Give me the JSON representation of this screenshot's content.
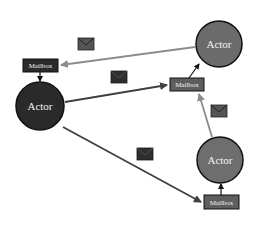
{
  "diagram": {
    "type": "actor-model",
    "colors": {
      "background": "#ffffff",
      "actor_dark": "#2a2a2a",
      "actor_gray": "#6b6b6b",
      "actor_border": "#111111",
      "mailbox_dark": "#2b2b2b",
      "mailbox_gray": "#5e5e5e",
      "arrow_dark": "#404040",
      "arrow_gray": "#8c8c8c",
      "envelope_dark": "#2e2e2e",
      "envelope_gray": "#555555",
      "label_text": "#f2f2f2"
    },
    "actors": [
      {
        "id": "actor-left",
        "label": "Actor",
        "cx": 40,
        "cy": 106,
        "r": 24,
        "fill": "#2a2a2a"
      },
      {
        "id": "actor-top-right",
        "label": "Actor",
        "cx": 219,
        "cy": 44,
        "r": 23,
        "fill": "#6b6b6b"
      },
      {
        "id": "actor-bottom-right",
        "label": "Actor",
        "cx": 220,
        "cy": 160,
        "r": 23,
        "fill": "#6e6e6e"
      }
    ],
    "mailboxes": [
      {
        "id": "mailbox-left",
        "label": "Mailbox",
        "x": 23,
        "y": 59,
        "w": 35,
        "h": 13,
        "fill": "#2b2b2b",
        "owner": "actor-left"
      },
      {
        "id": "mailbox-middle",
        "label": "Mailbox",
        "x": 170,
        "y": 78,
        "w": 34,
        "h": 13,
        "fill": "#5e5e5e",
        "owner": "actor-top-right"
      },
      {
        "id": "mailbox-bottom",
        "label": "Mailbox",
        "x": 204,
        "y": 195,
        "w": 35,
        "h": 14,
        "fill": "#5e5e5e",
        "owner": "actor-bottom-right"
      }
    ],
    "messages": [
      {
        "from": "actor-top-right",
        "to": "mailbox-left",
        "color": "#8c8c8c"
      },
      {
        "from": "actor-left",
        "to": "mailbox-middle",
        "color": "#404040"
      },
      {
        "from": "actor-left",
        "to": "mailbox-bottom",
        "color": "#404040"
      },
      {
        "from": "actor-bottom-right",
        "to": "mailbox-middle",
        "color": "#8c8c8c"
      }
    ],
    "envelopes": [
      {
        "id": "envelope-1",
        "x": 78,
        "y": 38,
        "w": 16,
        "h": 12,
        "fill": "#555555"
      },
      {
        "id": "envelope-2",
        "x": 111,
        "y": 71,
        "w": 16,
        "h": 12,
        "fill": "#2e2e2e"
      },
      {
        "id": "envelope-3",
        "x": 137,
        "y": 148,
        "w": 16,
        "h": 12,
        "fill": "#2e2e2e"
      },
      {
        "id": "envelope-4",
        "x": 211,
        "y": 105,
        "w": 16,
        "h": 12,
        "fill": "#555555"
      }
    ]
  }
}
